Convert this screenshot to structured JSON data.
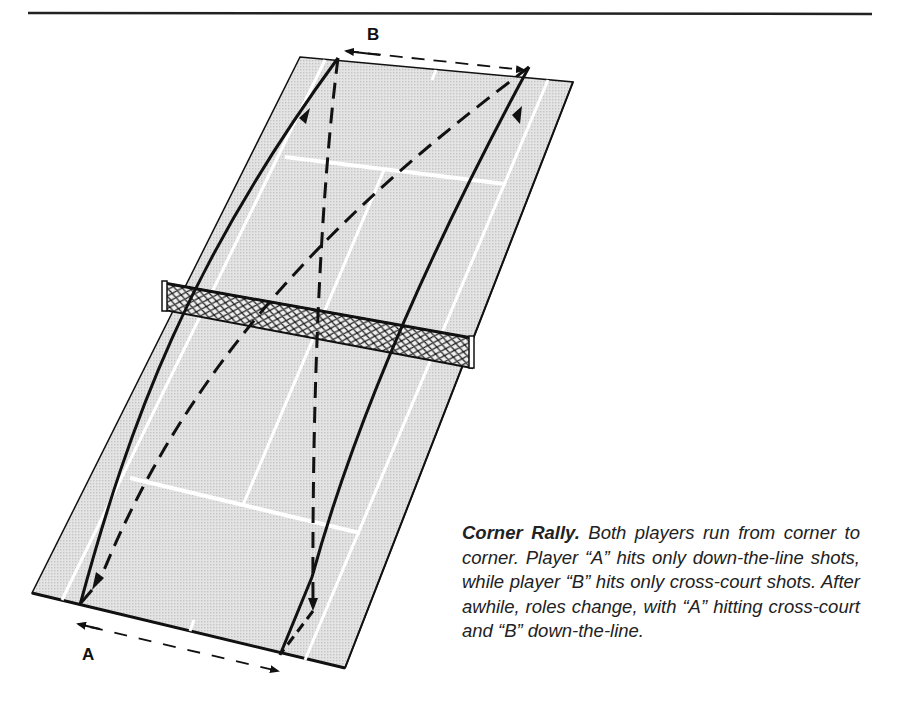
{
  "figure": {
    "labels": {
      "player_a": "A",
      "player_b": "B"
    },
    "caption": {
      "title": "Corner Rally.",
      "body": "Both players run from corner to corner. Player “A” hits only down-the-line shots, while player “B” hits only cross-court shots. After awhile, roles change, with “A” hitting cross-court and “B” down-the-line."
    },
    "colors": {
      "court_fill": "#dcdcdc",
      "court_lines": "#ffffff",
      "ink": "#111111",
      "background": "#ffffff"
    }
  }
}
